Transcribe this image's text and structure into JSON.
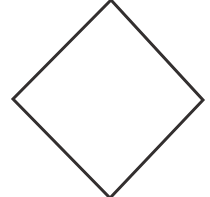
{
  "figure": {
    "canvas": {
      "width": 210,
      "height": 197,
      "background_color": "#ffffff"
    },
    "shape": {
      "name": "diamond",
      "type": "polygon",
      "sides": 4,
      "filled": false,
      "fill_color": "none",
      "stroke_color": "#332f2f",
      "stroke_width": 3,
      "vertices": [
        {
          "label": "top",
          "x": 111,
          "y": 0
        },
        {
          "label": "right",
          "x": 203,
          "y": 100
        },
        {
          "label": "bottom",
          "x": 110,
          "y": 198
        },
        {
          "label": "left",
          "x": 13,
          "y": 99
        }
      ],
      "points_attr": "111,0 203,100 110,198 13,99",
      "clipped_edges": [
        "top",
        "bottom"
      ]
    }
  }
}
